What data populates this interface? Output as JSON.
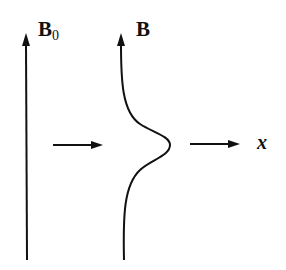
{
  "diagram": {
    "labels": {
      "uniform_field": "B",
      "uniform_field_subscript": "0",
      "perturbed_field": "B",
      "axis": "x"
    },
    "elements": [
      {
        "name": "uniform-field-line",
        "description": "straight vertical field line with upward arrow"
      },
      {
        "name": "transition-arrow",
        "description": "horizontal arrow pointing right"
      },
      {
        "name": "perturbed-field-line",
        "description": "vertical field line with localized bump toward +x, upward arrow"
      },
      {
        "name": "x-axis-arrow",
        "description": "horizontal arrow indicating x direction"
      }
    ],
    "colors": {
      "stroke": "#111111",
      "background": "#ffffff"
    }
  }
}
